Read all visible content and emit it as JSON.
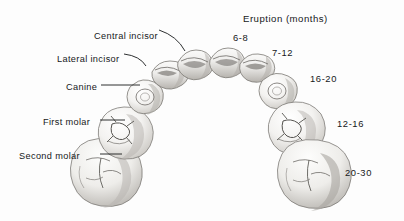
{
  "figure": {
    "kind": "primary-dentition-eruption-chart",
    "background_color": "#fdfdfd",
    "ink_color": "#16181a",
    "tooth_fill": "#f2f1ef",
    "tooth_shade": "#9a9894"
  },
  "title": {
    "text": "Eruption (months)",
    "x": 243,
    "y": 14
  },
  "tooth_labels": [
    {
      "id": "central-incisor",
      "text": "Central incisor",
      "x": 94,
      "y": 32
    },
    {
      "id": "lateral-incisor",
      "text": "Lateral incisor",
      "x": 57,
      "y": 55
    },
    {
      "id": "canine",
      "text": "Canine",
      "x": 66,
      "y": 83
    },
    {
      "id": "first-molar",
      "text": "First molar",
      "x": 43,
      "y": 118
    },
    {
      "id": "second-molar",
      "text": "Second molar",
      "x": 19,
      "y": 152
    }
  ],
  "eruption_labels": [
    {
      "id": "eruption-6-8",
      "text": "6-8",
      "x": 233,
      "y": 33,
      "tooth": "central incisor"
    },
    {
      "id": "eruption-7-12",
      "text": "7-12",
      "x": 272,
      "y": 48,
      "tooth": "lateral incisor"
    },
    {
      "id": "eruption-16-20",
      "text": "16-20",
      "x": 310,
      "y": 74,
      "tooth": "canine"
    },
    {
      "id": "eruption-12-16",
      "text": "12-16",
      "x": 337,
      "y": 119,
      "tooth": "first molar"
    },
    {
      "id": "eruption-20-30",
      "text": "20-30",
      "x": 345,
      "y": 168,
      "tooth": "second molar"
    }
  ],
  "teeth": [
    {
      "id": "second-molar-left",
      "type": "second molar",
      "side": "left",
      "cx": 103,
      "cy": 165
    },
    {
      "id": "first-molar-left",
      "type": "first molar",
      "side": "left",
      "cx": 125,
      "cy": 128
    },
    {
      "id": "canine-left",
      "type": "canine",
      "side": "left",
      "cx": 143,
      "cy": 97
    },
    {
      "id": "lateral-incisor-left",
      "type": "lateral incisor",
      "side": "left",
      "cx": 166,
      "cy": 73
    },
    {
      "id": "central-incisor-left",
      "type": "central incisor",
      "side": "left",
      "cx": 193,
      "cy": 62
    },
    {
      "id": "central-incisor-right",
      "type": "central incisor",
      "side": "right",
      "cx": 224,
      "cy": 60
    },
    {
      "id": "lateral-incisor-right",
      "type": "lateral incisor",
      "side": "right",
      "cx": 252,
      "cy": 66
    },
    {
      "id": "canine-right",
      "type": "canine",
      "side": "right",
      "cx": 275,
      "cy": 90
    },
    {
      "id": "first-molar-right",
      "type": "first molar",
      "side": "right",
      "cx": 297,
      "cy": 124
    },
    {
      "id": "second-molar-right",
      "type": "second molar",
      "side": "right",
      "cx": 310,
      "cy": 167
    }
  ]
}
